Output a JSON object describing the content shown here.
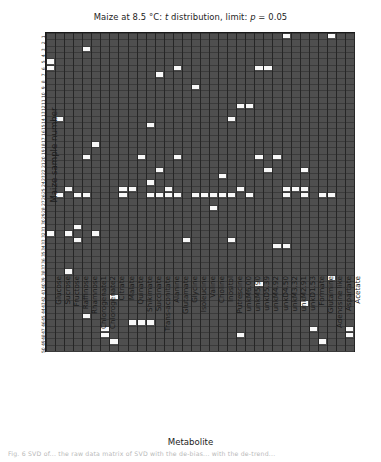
{
  "figure": {
    "title_prefix": "Maize at 8.5 °C: ",
    "title_italic1": "t",
    "title_mid": " distribution, limit: ",
    "title_italic2": "p",
    "title_suffix": " = 0.05",
    "title_plain": "Maize at 8.5 °C: t distribution, limit: p = 0.05",
    "xlabel": "Metabolite",
    "ylabel": "Maize sample number",
    "caption": "Fig. 6 SVD of... the raw data matrix of SVD with the de-bias... with the de-trend..."
  },
  "colors": {
    "background": "#4f4f4f",
    "significant": "#f8f8f8",
    "gridline": "#262626",
    "border": "#1a1a1a",
    "text": "#1c1c1c"
  },
  "chart_data": {
    "type": "heatmap",
    "title": "Maize at 8.5 °C: t distribution, limit: p = 0.05",
    "xlabel": "Metabolite",
    "ylabel": "Maize sample number",
    "grid": true,
    "legend": "none",
    "value_meaning": {
      "0": "not significant (dark grey)",
      "1": "significant, p < 0.05 (white)"
    },
    "categories": [
      "Glucose",
      "Sucrose",
      "Fructose",
      "Raffinose",
      "Rhamnose",
      "Chlorogenate1",
      "Chlorogenate2",
      "Citrate",
      "Malate",
      "Quinate",
      "Shikimate",
      "Succinate",
      "Trans-aconitate",
      "Alanine",
      "Glutamate",
      "Glycine",
      "Isoleucine",
      "Valine",
      "Choline",
      "Inositol",
      "Putrescine",
      "unkM6.00",
      "unkM5.90",
      "unkD5.39",
      "unkM4.92",
      "unkD4.50",
      "unkM3.32",
      "unkM2.91",
      "unkD1.53",
      "Formate",
      "Glutamine",
      "Adenosine like",
      "Aspartate",
      "Acetate"
    ],
    "rows": [
      "1",
      "2",
      "3",
      "4",
      "5",
      "6",
      "7",
      "8",
      "9",
      "10",
      "11",
      "12",
      "13",
      "14",
      "15",
      "16",
      "17",
      "18",
      "19",
      "20",
      "21",
      "22",
      "23",
      "24",
      "25",
      "26",
      "27",
      "28",
      "29",
      "30",
      "31",
      "32",
      "33",
      "34",
      "35",
      "36",
      "37",
      "38",
      "39",
      "40",
      "41",
      "42",
      "43",
      "44",
      "45",
      "46",
      "47",
      "48",
      "49",
      "50"
    ],
    "ylim": [
      1,
      50
    ],
    "n_rows": 50,
    "n_cols": 34,
    "hits": [
      [
        0,
        26
      ],
      [
        0,
        31
      ],
      [
        2,
        4
      ],
      [
        4,
        0
      ],
      [
        5,
        0
      ],
      [
        5,
        14
      ],
      [
        5,
        23
      ],
      [
        5,
        24
      ],
      [
        6,
        12
      ],
      [
        8,
        16
      ],
      [
        11,
        21
      ],
      [
        11,
        22
      ],
      [
        13,
        1
      ],
      [
        13,
        20
      ],
      [
        14,
        11
      ],
      [
        17,
        5
      ],
      [
        19,
        4
      ],
      [
        19,
        10
      ],
      [
        19,
        14
      ],
      [
        19,
        23
      ],
      [
        19,
        25
      ],
      [
        21,
        12
      ],
      [
        21,
        24
      ],
      [
        21,
        28
      ],
      [
        22,
        19
      ],
      [
        23,
        11
      ],
      [
        24,
        2
      ],
      [
        24,
        8
      ],
      [
        24,
        9
      ],
      [
        24,
        13
      ],
      [
        24,
        21
      ],
      [
        24,
        26
      ],
      [
        24,
        27
      ],
      [
        24,
        28
      ],
      [
        25,
        1
      ],
      [
        25,
        3
      ],
      [
        25,
        4
      ],
      [
        25,
        8
      ],
      [
        25,
        11
      ],
      [
        25,
        12
      ],
      [
        25,
        13
      ],
      [
        25,
        14
      ],
      [
        25,
        16
      ],
      [
        25,
        17
      ],
      [
        25,
        18
      ],
      [
        25,
        19
      ],
      [
        25,
        20
      ],
      [
        25,
        22
      ],
      [
        25,
        26
      ],
      [
        25,
        28
      ],
      [
        25,
        30
      ],
      [
        25,
        31
      ],
      [
        27,
        18
      ],
      [
        30,
        3
      ],
      [
        31,
        0
      ],
      [
        31,
        2
      ],
      [
        31,
        5
      ],
      [
        32,
        3
      ],
      [
        32,
        15
      ],
      [
        32,
        20
      ],
      [
        33,
        25
      ],
      [
        33,
        26
      ],
      [
        37,
        2
      ],
      [
        38,
        31
      ],
      [
        39,
        23
      ],
      [
        41,
        7
      ],
      [
        42,
        28
      ],
      [
        44,
        4
      ],
      [
        45,
        9
      ],
      [
        45,
        10
      ],
      [
        45,
        11
      ],
      [
        46,
        6
      ],
      [
        46,
        29
      ],
      [
        46,
        33
      ],
      [
        47,
        6
      ],
      [
        47,
        21
      ],
      [
        47,
        33
      ],
      [
        48,
        7
      ],
      [
        48,
        30
      ]
    ]
  }
}
